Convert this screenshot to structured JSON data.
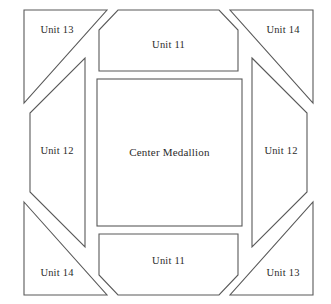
{
  "diagram": {
    "kind": "quilt-block-layout",
    "background_color": "#ffffff",
    "line_color": "#595959",
    "text_color": "#2b2b2b",
    "center": {
      "label": "Center Medallion",
      "shape": "rectangle"
    },
    "pieces": [
      {
        "id": "corner-top-left",
        "label": "Unit 13",
        "shape": "triangle",
        "position": "top-left"
      },
      {
        "id": "side-top",
        "label": "Unit 11",
        "shape": "trapezoid",
        "position": "top"
      },
      {
        "id": "corner-top-right",
        "label": "Unit 14",
        "shape": "triangle",
        "position": "top-right"
      },
      {
        "id": "side-left",
        "label": "Unit 12",
        "shape": "hexagon",
        "position": "left"
      },
      {
        "id": "side-right",
        "label": "Unit 12",
        "shape": "hexagon",
        "position": "right"
      },
      {
        "id": "corner-bottom-left",
        "label": "Unit 14",
        "shape": "triangle",
        "position": "bottom-left"
      },
      {
        "id": "side-bottom",
        "label": "Unit 11",
        "shape": "trapezoid",
        "position": "bottom"
      },
      {
        "id": "corner-bottom-right",
        "label": "Unit 13",
        "shape": "triangle",
        "position": "bottom-right"
      }
    ]
  }
}
